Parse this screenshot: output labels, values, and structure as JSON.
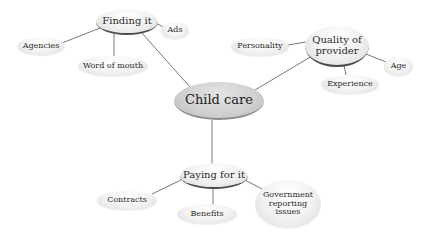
{
  "diagram": {
    "type": "mind-map",
    "colors": {
      "line": "#555555",
      "center_fill": "#cfcfcf",
      "leaf_fill": "#f1f1f1",
      "branch_shadow": "#4a4a4a"
    },
    "center": {
      "label": "Child care"
    },
    "branches": [
      {
        "label": "Finding it",
        "children": [
          {
            "label": "Ads"
          },
          {
            "label": "Agencies"
          },
          {
            "label": "Word of mouth"
          }
        ]
      },
      {
        "label_lines": [
          "Quality of",
          "provider"
        ],
        "children": [
          {
            "label": "Personality"
          },
          {
            "label": "Age"
          },
          {
            "label": "Experience"
          }
        ]
      },
      {
        "label": "Paying for it",
        "children": [
          {
            "label": "Contracts"
          },
          {
            "label": "Benefits"
          },
          {
            "label_lines": [
              "Government",
              "reporting",
              "issues"
            ]
          }
        ]
      }
    ]
  }
}
